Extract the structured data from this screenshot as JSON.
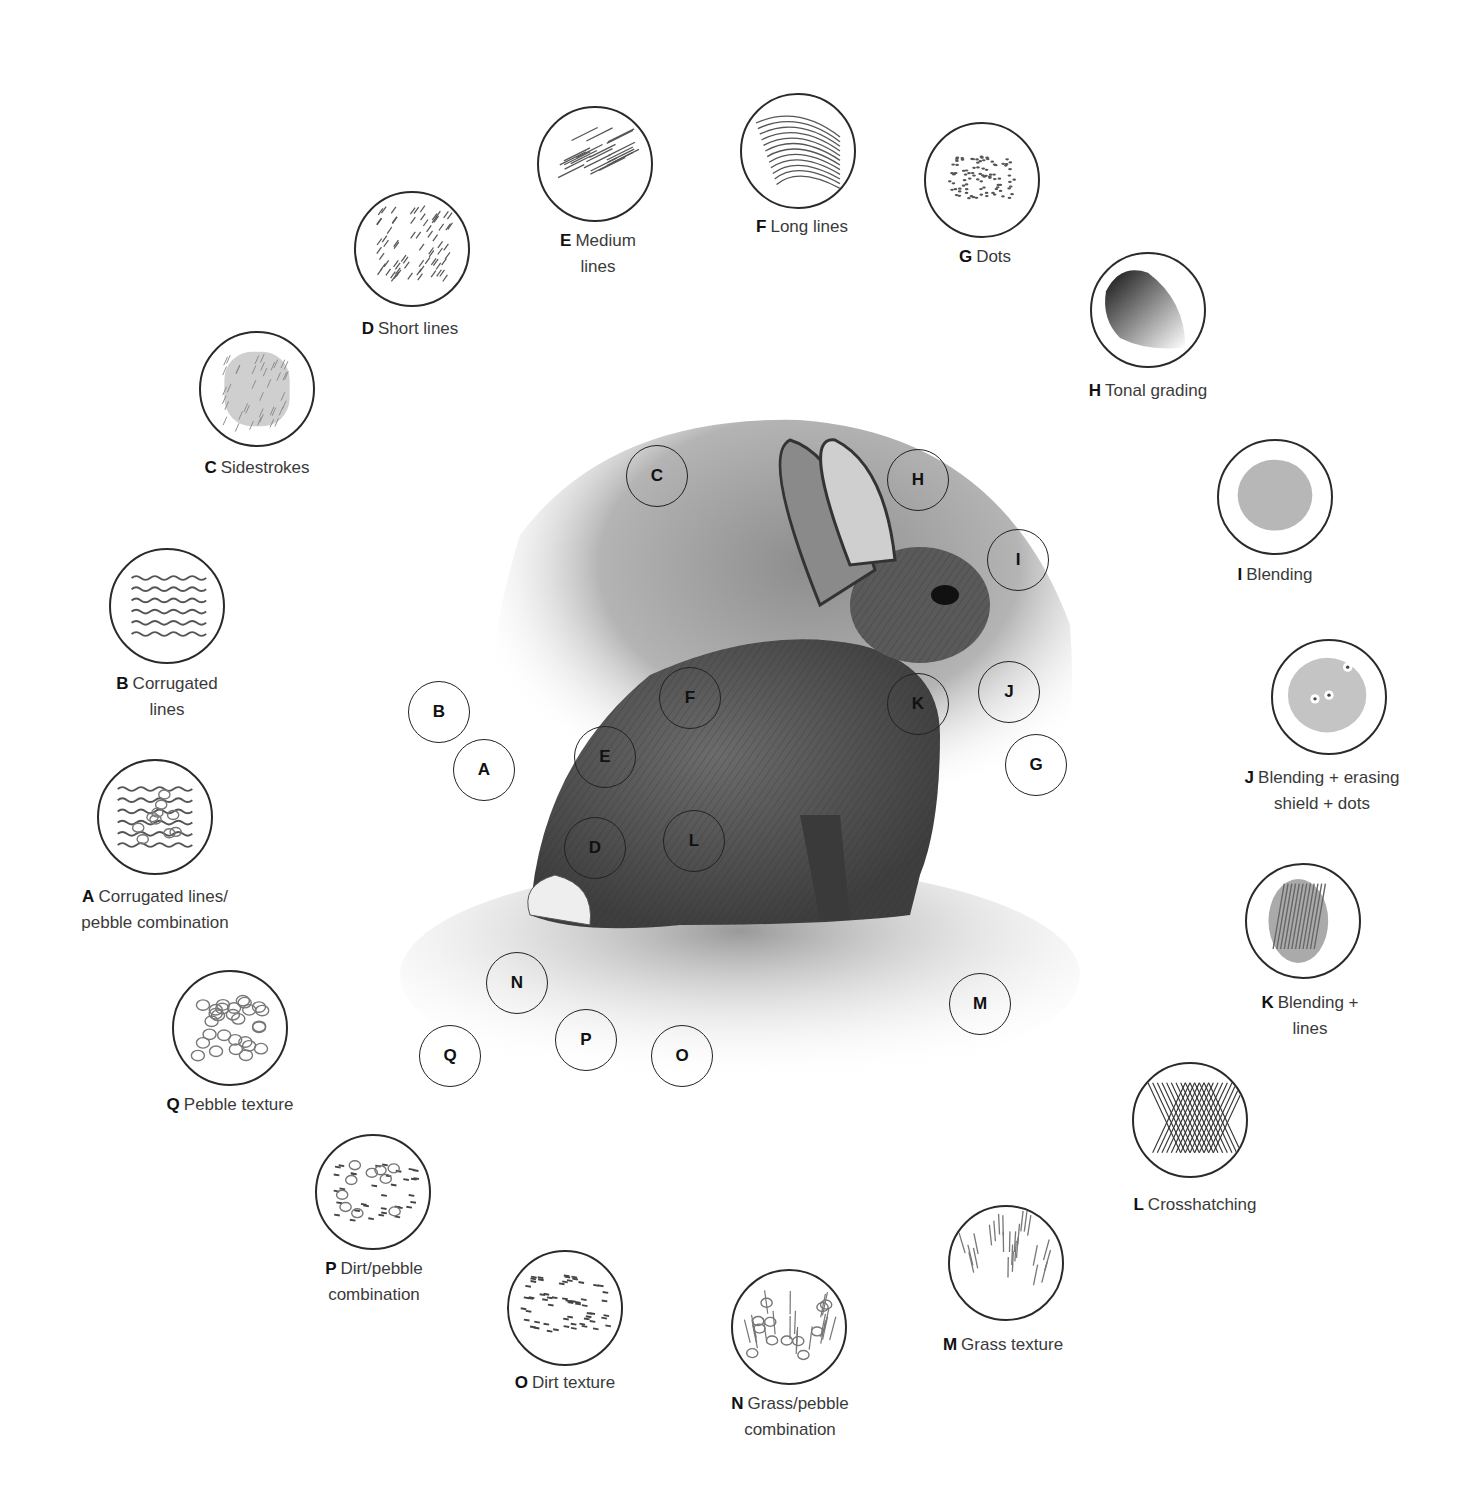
{
  "techniques": [
    {
      "key": "A",
      "label_bold": "A",
      "label_text": "Corrugated lines/",
      "label_line2": "pebble combination",
      "swatch": {
        "cx": 155,
        "cy": 817,
        "r": 58
      },
      "label_pos": {
        "x": 155,
        "y": 884
      },
      "marker": {
        "cx": 484,
        "cy": 770
      },
      "pattern": "corrugated-pebble"
    },
    {
      "key": "B",
      "label_bold": "B",
      "label_text": "Corrugated",
      "label_line2": "lines",
      "swatch": {
        "cx": 167,
        "cy": 606,
        "r": 58
      },
      "label_pos": {
        "x": 167,
        "y": 671
      },
      "marker": {
        "cx": 439,
        "cy": 712
      },
      "pattern": "corrugated"
    },
    {
      "key": "C",
      "label_bold": "C",
      "label_text": "Sidestrokes",
      "label_line2": "",
      "swatch": {
        "cx": 257,
        "cy": 389,
        "r": 58
      },
      "label_pos": {
        "x": 257,
        "y": 455
      },
      "marker": {
        "cx": 657,
        "cy": 476
      },
      "pattern": "sidestrokes"
    },
    {
      "key": "D",
      "label_bold": "D",
      "label_text": "Short lines",
      "label_line2": "",
      "swatch": {
        "cx": 412,
        "cy": 249,
        "r": 58
      },
      "label_pos": {
        "x": 410,
        "y": 316
      },
      "marker": {
        "cx": 595,
        "cy": 848
      },
      "pattern": "short-lines"
    },
    {
      "key": "E",
      "label_bold": "E",
      "label_text": "Medium",
      "label_line2": "lines",
      "swatch": {
        "cx": 595,
        "cy": 164,
        "r": 58
      },
      "label_pos": {
        "x": 598,
        "y": 228
      },
      "marker": {
        "cx": 605,
        "cy": 757
      },
      "pattern": "medium-lines"
    },
    {
      "key": "F",
      "label_bold": "F",
      "label_text": "Long lines",
      "label_line2": "",
      "swatch": {
        "cx": 798,
        "cy": 151,
        "r": 58
      },
      "label_pos": {
        "x": 802,
        "y": 214
      },
      "marker": {
        "cx": 690,
        "cy": 698
      },
      "pattern": "long-lines"
    },
    {
      "key": "G",
      "label_bold": "G",
      "label_text": "Dots",
      "label_line2": "",
      "swatch": {
        "cx": 982,
        "cy": 180,
        "r": 58
      },
      "label_pos": {
        "x": 985,
        "y": 244
      },
      "marker": {
        "cx": 1036,
        "cy": 765
      },
      "pattern": "dots"
    },
    {
      "key": "H",
      "label_bold": "H",
      "label_text": "Tonal grading",
      "label_line2": "",
      "swatch": {
        "cx": 1148,
        "cy": 310,
        "r": 58
      },
      "label_pos": {
        "x": 1148,
        "y": 378
      },
      "marker": {
        "cx": 918,
        "cy": 480
      },
      "pattern": "tonal-grading"
    },
    {
      "key": "I",
      "label_bold": "I",
      "label_text": "Blending",
      "label_line2": "",
      "swatch": {
        "cx": 1275,
        "cy": 497,
        "r": 58
      },
      "label_pos": {
        "x": 1275,
        "y": 562
      },
      "marker": {
        "cx": 1018,
        "cy": 560
      },
      "pattern": "blending"
    },
    {
      "key": "J",
      "label_bold": "J",
      "label_text": "Blending + erasing",
      "label_line2": "shield + dots",
      "swatch": {
        "cx": 1329,
        "cy": 697,
        "r": 58
      },
      "label_pos": {
        "x": 1322,
        "y": 765
      },
      "marker": {
        "cx": 1009,
        "cy": 692
      },
      "pattern": "blending-erasing"
    },
    {
      "key": "K",
      "label_bold": "K",
      "label_text": "Blending +",
      "label_line2": "lines",
      "swatch": {
        "cx": 1303,
        "cy": 921,
        "r": 58
      },
      "label_pos": {
        "x": 1310,
        "y": 990
      },
      "marker": {
        "cx": 918,
        "cy": 704
      },
      "pattern": "blending-lines"
    },
    {
      "key": "L",
      "label_bold": "L",
      "label_text": "Crosshatching",
      "label_line2": "",
      "swatch": {
        "cx": 1190,
        "cy": 1120,
        "r": 58
      },
      "label_pos": {
        "x": 1195,
        "y": 1192
      },
      "marker": {
        "cx": 694,
        "cy": 841
      },
      "pattern": "crosshatch"
    },
    {
      "key": "M",
      "label_bold": "M",
      "label_text": "Grass texture",
      "label_line2": "",
      "swatch": {
        "cx": 1006,
        "cy": 1263,
        "r": 58
      },
      "label_pos": {
        "x": 1003,
        "y": 1332
      },
      "marker": {
        "cx": 980,
        "cy": 1004
      },
      "pattern": "grass"
    },
    {
      "key": "N",
      "label_bold": "N",
      "label_text": "Grass/pebble",
      "label_line2": "combination",
      "swatch": {
        "cx": 789,
        "cy": 1327,
        "r": 58
      },
      "label_pos": {
        "x": 790,
        "y": 1391
      },
      "marker": {
        "cx": 517,
        "cy": 983
      },
      "pattern": "grass-pebble"
    },
    {
      "key": "O",
      "label_bold": "O",
      "label_text": "Dirt texture",
      "label_line2": "",
      "swatch": {
        "cx": 565,
        "cy": 1308,
        "r": 58
      },
      "label_pos": {
        "x": 565,
        "y": 1370
      },
      "marker": {
        "cx": 682,
        "cy": 1056
      },
      "pattern": "dirt"
    },
    {
      "key": "P",
      "label_bold": "P",
      "label_text": "Dirt/pebble",
      "label_line2": "combination",
      "swatch": {
        "cx": 373,
        "cy": 1192,
        "r": 58
      },
      "label_pos": {
        "x": 374,
        "y": 1256
      },
      "marker": {
        "cx": 586,
        "cy": 1040
      },
      "pattern": "dirt-pebble"
    },
    {
      "key": "Q",
      "label_bold": "Q",
      "label_text": "Pebble texture",
      "label_line2": "",
      "swatch": {
        "cx": 230,
        "cy": 1028,
        "r": 58
      },
      "label_pos": {
        "x": 230,
        "y": 1092
      },
      "marker": {
        "cx": 450,
        "cy": 1056
      },
      "pattern": "pebbles"
    }
  ],
  "marker_radius": 31,
  "colors": {
    "outline": "#2a2a2a",
    "label": "#3a3a3a",
    "graphite": "#555555",
    "bold": "#111111"
  }
}
